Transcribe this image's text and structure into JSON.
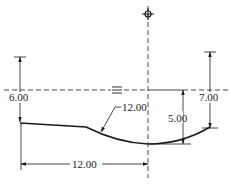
{
  "drawing": {
    "type": "engineering-dimension-drawing",
    "line_color": "#1a1a1a",
    "background": "#ffffff",
    "symbols": {
      "center_mark": "center-target-icon",
      "flat_symbol": "≡"
    },
    "dimensions": {
      "left_height": "6.00",
      "leader_radius": "12.00",
      "center_depth": "5.00",
      "right_height": "7.00",
      "bottom_width": "12.00"
    }
  }
}
